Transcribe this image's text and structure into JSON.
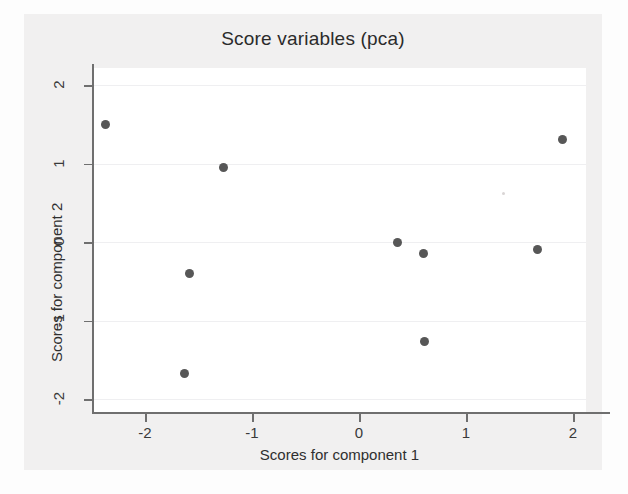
{
  "chart_data": {
    "type": "scatter",
    "title": "Score variables (pca)",
    "xlabel": "Scores for component 1",
    "ylabel": "Scores for component 2",
    "xlim": [
      -2.62,
      2.24
    ],
    "ylim": [
      -2.12,
      2.12
    ],
    "xticks": [
      -2,
      -1,
      0,
      1,
      2
    ],
    "xtick_labels": [
      "-2",
      "-1",
      "0",
      "1",
      "2"
    ],
    "yticks": [
      -2,
      -1,
      0,
      1,
      2
    ],
    "ytick_labels": [
      "-2",
      "-1",
      "0",
      "1",
      "2"
    ],
    "grid": "horizontal",
    "legend": "none",
    "marker": {
      "shape": "circle",
      "color": "#575757",
      "size_px": 9
    },
    "points": [
      {
        "x": -2.37,
        "y": 1.5
      },
      {
        "x": -1.27,
        "y": 0.95
      },
      {
        "x": -1.58,
        "y": -0.4
      },
      {
        "x": -1.63,
        "y": -1.68
      },
      {
        "x": 0.36,
        "y": -0.01
      },
      {
        "x": 0.6,
        "y": -0.15
      },
      {
        "x": 0.61,
        "y": -1.27
      },
      {
        "x": 1.67,
        "y": -0.09
      },
      {
        "x": 1.9,
        "y": 1.31
      }
    ]
  },
  "colors": {
    "figure_background": "#f1f0f0",
    "plot_background": "#ffffff",
    "axis_line": "#6f6f6f",
    "gridline": "#efeff1",
    "text": "#2f2f2f",
    "marker": "#575757"
  }
}
